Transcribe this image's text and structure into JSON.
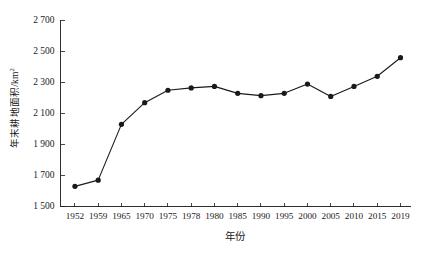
{
  "chart_data": {
    "type": "line",
    "title": "",
    "subtitle": "",
    "xlabel": "年份",
    "ylabel": "年末耕地面积/km²",
    "ylabel_text": "年末耕地面积/km",
    "ylabel_sup": "2",
    "categories": [
      "1952",
      "1959",
      "1965",
      "1970",
      "1975",
      "1978",
      "1980",
      "1985",
      "1990",
      "1995",
      "2000",
      "2005",
      "2010",
      "2015",
      "2019"
    ],
    "values": [
      1630,
      1670,
      2030,
      2170,
      2250,
      2265,
      2275,
      2230,
      2215,
      2230,
      2290,
      2210,
      2275,
      2340,
      2460
    ],
    "series": [
      {
        "name": "年末耕地面积",
        "values": [
          1630,
          1670,
          2030,
          2170,
          2250,
          2265,
          2275,
          2230,
          2215,
          2230,
          2290,
          2210,
          2275,
          2340,
          2460
        ]
      }
    ],
    "ylim": [
      1500,
      2700
    ],
    "ytick_values": [
      1500,
      1700,
      1900,
      2100,
      2300,
      2500,
      2700
    ],
    "ytick_labels": [
      "1 500",
      "1 700",
      "1 900",
      "2 100",
      "2 300",
      "2 500",
      "2 700"
    ],
    "grid": false,
    "legend": false,
    "legend_position": "none",
    "marker": "filled-circle",
    "line_color": "#1a1a1a",
    "marker_color": "#1a1a1a",
    "background_color": "#ffffff"
  }
}
